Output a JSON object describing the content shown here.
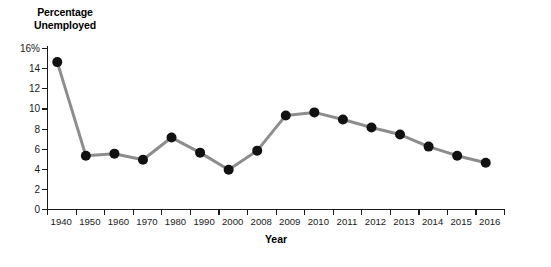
{
  "chart_data": {
    "type": "line",
    "title": "Percentage Unemployed",
    "title_line1": "Percentage",
    "title_line2": "Unemployed",
    "xlabel": "Year",
    "ylabel": "Percentage Unemployed",
    "categories": [
      "1940",
      "1950",
      "1960",
      "1970",
      "1980",
      "1990",
      "2000",
      "2008",
      "2009",
      "2010",
      "2011",
      "2012",
      "2013",
      "2014",
      "2015",
      "2016"
    ],
    "values": [
      14.6,
      5.3,
      5.5,
      4.9,
      7.1,
      5.6,
      3.9,
      5.8,
      9.3,
      9.6,
      8.9,
      8.1,
      7.4,
      6.2,
      5.3,
      4.6
    ],
    "ytick_labels": [
      "16%",
      "14",
      "12",
      "10",
      "8",
      "6",
      "4",
      "2",
      "0"
    ],
    "ytick_values": [
      16,
      14,
      12,
      10,
      8,
      6,
      4,
      2,
      0
    ],
    "ylim": [
      0,
      16
    ],
    "grid": false,
    "legend": "none",
    "marker_color": "#111111",
    "line_color": "#8d8d8d",
    "axis_color": "#1a1a1a"
  }
}
